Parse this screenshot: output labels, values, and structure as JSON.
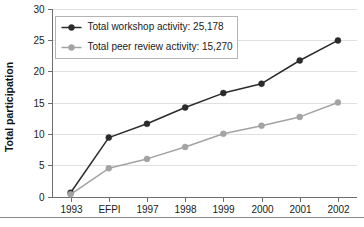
{
  "chart_data": {
    "type": "line",
    "title": "",
    "xlabel": "",
    "ylabel": "Total participation",
    "categories": [
      "1993",
      "EFPI",
      "1997",
      "1998",
      "1999",
      "2000",
      "2001",
      "2002"
    ],
    "ylim": [
      0,
      30
    ],
    "yticks": [
      0,
      5,
      10,
      15,
      20,
      25,
      30
    ],
    "ytick_labels": [
      "0",
      "5",
      "10",
      "15",
      "20",
      "25",
      "30"
    ],
    "grid": true,
    "legend_position": "upper-left-inside",
    "series": [
      {
        "name": "Total workshop activity: 25,178",
        "short_name": "Total workshop activity",
        "total": "25,178",
        "color": "#2b2b2b",
        "marker": "circle",
        "values": [
          0.6,
          9.4,
          11.6,
          14.2,
          16.5,
          18.0,
          21.7,
          24.9
        ]
      },
      {
        "name": "Total peer review activity: 15,270",
        "short_name": "Total peer review activity",
        "total": "15,270",
        "color": "#a3a3a3",
        "marker": "circle",
        "values": [
          0.35,
          4.5,
          6.0,
          7.9,
          10.0,
          11.3,
          12.7,
          15.0
        ]
      }
    ]
  },
  "colors": {
    "workshop": "#2b2b2b",
    "peer_review": "#a3a3a3",
    "grid": "#d8d8d8",
    "axis": "#6e6e6e",
    "background": "#ffffff"
  }
}
